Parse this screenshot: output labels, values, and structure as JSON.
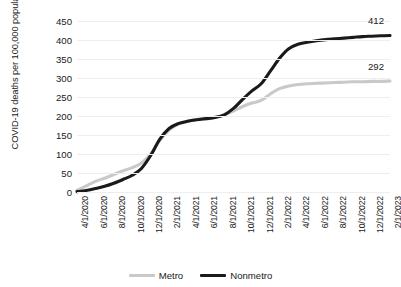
{
  "chart_data": {
    "type": "line",
    "title": "",
    "xlabel": "",
    "ylabel": "COVID-19 deaths per 100,000 population",
    "ylim": [
      0,
      450
    ],
    "ytick_step": 50,
    "yticks": [
      450,
      400,
      350,
      300,
      250,
      200,
      150,
      100,
      50,
      0
    ],
    "grid": true,
    "legend_position": "bottom-center",
    "x_tick_labels": [
      "4/1/2020",
      "6/1/2020",
      "8/1/2020",
      "10/1/2020",
      "12/1/2020",
      "2/1/2021",
      "4/1/2021",
      "6/1/2021",
      "8/1/2021",
      "10/1/2021",
      "12/1/2021",
      "2/1/2022",
      "4/1/2022",
      "6/1/2022",
      "8/1/2022",
      "10/1/2022",
      "12/1/2022",
      "2/1/2023"
    ],
    "x": [
      "4/1/2020",
      "5/1/2020",
      "6/1/2020",
      "7/1/2020",
      "8/1/2020",
      "9/1/2020",
      "10/1/2020",
      "11/1/2020",
      "12/1/2020",
      "1/1/2021",
      "2/1/2021",
      "3/1/2021",
      "4/1/2021",
      "5/1/2021",
      "6/1/2021",
      "7/1/2021",
      "8/1/2021",
      "9/1/2021",
      "10/1/2021",
      "11/1/2021",
      "12/1/2021",
      "1/1/2022",
      "2/1/2022",
      "3/1/2022",
      "4/1/2022",
      "5/1/2022",
      "6/1/2022",
      "7/1/2022",
      "8/1/2022",
      "9/1/2022",
      "10/1/2022",
      "11/1/2022",
      "12/1/2022",
      "1/1/2023",
      "2/1/2023"
    ],
    "series": [
      {
        "name": "Metro",
        "color": "#c9c9c9",
        "end_label": "292",
        "values": [
          4,
          16,
          28,
          36,
          46,
          56,
          64,
          76,
          100,
          136,
          163,
          179,
          186,
          191,
          194,
          197,
          203,
          213,
          225,
          234,
          241,
          258,
          272,
          279,
          283,
          285,
          286,
          287,
          288,
          289,
          290,
          290,
          291,
          291,
          292
        ]
      },
      {
        "name": "Nonmetro",
        "color": "#1a1a1a",
        "end_label": "412",
        "values": [
          1,
          4,
          9,
          15,
          23,
          33,
          44,
          62,
          96,
          139,
          167,
          180,
          186,
          190,
          193,
          196,
          203,
          220,
          244,
          266,
          285,
          318,
          352,
          377,
          389,
          394,
          398,
          401,
          403,
          405,
          407,
          409,
          410,
          411,
          412
        ]
      }
    ],
    "legend": [
      "Metro",
      "Nonmetro"
    ]
  }
}
